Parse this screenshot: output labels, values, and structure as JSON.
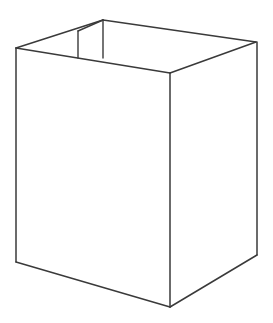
{
  "figure": {
    "style": "line-drawing",
    "background_color": "#ffffff",
    "stroke_color": "#3a3a3a",
    "stroke_width": 1.5,
    "canvas": {
      "width": 273,
      "height": 323
    },
    "text_content": "",
    "vertices": {
      "back_apex": [
        103,
        20
      ],
      "left_back_corner": [
        16,
        48
      ],
      "right_back_corner": [
        256,
        42
      ],
      "front_top_corner": [
        170,
        73
      ],
      "left_bottom_corner": [
        16,
        262
      ],
      "front_bottom_corner": [
        170,
        307
      ],
      "right_bottom_corner": [
        257,
        255
      ],
      "flap_left_top": [
        78,
        31
      ],
      "flap_left_bottom": [
        78,
        58
      ],
      "flap_right_top": [
        103,
        20
      ],
      "flap_right_bottom": [
        103,
        58
      ],
      "rim_inner_left": [
        16,
        48
      ],
      "rim_inner_mid": [
        170,
        73
      ]
    },
    "paths": {
      "rim_outer_left": "M 16 48 L 103 20",
      "rim_outer_right": "M 103 20 L 256 42",
      "rim_inner_left": "M 16 48 L 170 73",
      "rim_inner_right": "M 170 73 L 256 42",
      "edge_left_vertical": "M 16 48 L 16 262",
      "edge_front_vertical": "M 170 73 L 170 307",
      "edge_right_vertical": "M 257 42 L 257 255",
      "base_left": "M 16 262 L 170 307",
      "base_right": "M 170 307 L 257 255",
      "flap_left_vertical": "M 78 31 L 78 58",
      "flap_right_vertical": "M 103 20 L 103 58",
      "flap_diagonal": "M 78 31 L 103 20",
      "flap_base": "M 78 58 L 103 58",
      "face_left_panel": "M 16 48 L 170 73 L 170 307 L 16 262 Z",
      "face_right_panel": "M 170 73 L 257 42 L 257 255 L 170 307 Z",
      "face_rim_band": "M 16 48 L 103 20 L 256 42 L 170 73 Z"
    }
  },
  "elements": [
    {
      "name": "rim-outer-left-edge",
      "label": "Outer rim edge, left-back"
    },
    {
      "name": "rim-outer-right-edge",
      "label": "Outer rim edge, right-back"
    },
    {
      "name": "rim-inner-left-edge",
      "label": "Inner rim edge, left-front"
    },
    {
      "name": "rim-inner-right-edge",
      "label": "Inner rim edge, right-front"
    },
    {
      "name": "left-panel-vertical-edge",
      "label": "Left vertical corner edge"
    },
    {
      "name": "front-panel-vertical-edge",
      "label": "Front vertical corner edge"
    },
    {
      "name": "right-panel-vertical-edge",
      "label": "Right vertical corner edge"
    },
    {
      "name": "base-left-edge",
      "label": "Bottom edge, left"
    },
    {
      "name": "base-right-edge",
      "label": "Bottom edge, right"
    },
    {
      "name": "inner-flap",
      "label": "Inner flap at back-left of opening"
    }
  ]
}
